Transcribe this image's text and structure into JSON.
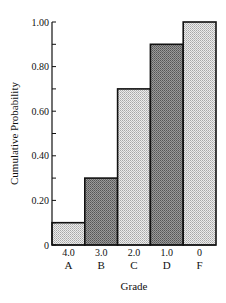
{
  "chart_data": {
    "type": "bar",
    "title": "",
    "xlabel": "Grade",
    "ylabel": "Cumulative Probability",
    "categories": [
      "A",
      "B",
      "C",
      "D",
      "F"
    ],
    "category_points": [
      "4.0",
      "3.0",
      "2.0",
      "1.0",
      "0"
    ],
    "values": [
      0.1,
      0.3,
      0.7,
      0.9,
      1.0
    ],
    "ylim": [
      0,
      1.0
    ],
    "yticks": [
      0,
      0.2,
      0.4,
      0.6,
      0.8,
      1.0
    ],
    "ytick_labels": [
      "0",
      "0.20",
      "0.40",
      "0.60",
      "0.80",
      "1.00"
    ],
    "minor_yticks": [
      0.1,
      0.3,
      0.5,
      0.7,
      0.9
    ],
    "grid": false,
    "legend": null,
    "bar_shading": [
      "light",
      "dark",
      "light",
      "dark",
      "light"
    ]
  },
  "colors": {
    "light_fill": "#d6d6d6",
    "dark_fill": "#8a8a8a",
    "stroke": "#111111"
  }
}
